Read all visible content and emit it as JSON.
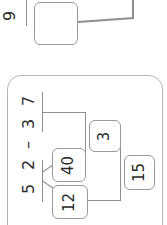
{
  "top_problem": {
    "number_label": "9",
    "answer_box": ""
  },
  "main_problem": {
    "expression": [
      "5",
      "2",
      "–",
      "3",
      "7"
    ],
    "decomposition": {
      "left_part_a": "12",
      "left_part_b": "40",
      "step_result": "3",
      "final_result": "15"
    }
  },
  "colors": {
    "box_border": "#9a9a9a",
    "frame_border": "#b5b5b5",
    "line": "#8f8f8f",
    "text": "#2a2a2a"
  }
}
